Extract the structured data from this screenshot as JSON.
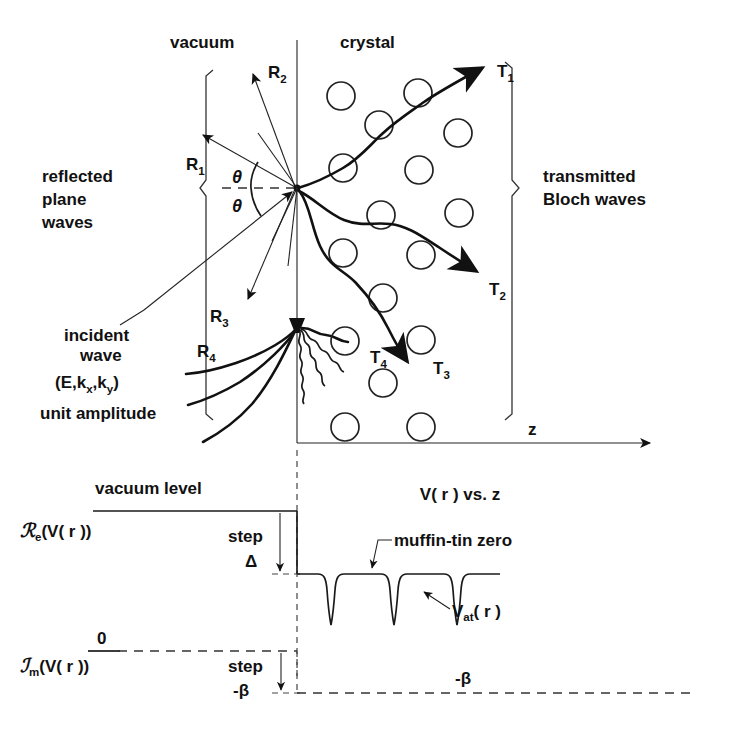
{
  "figure": {
    "regions": {
      "vacuum": "vacuum",
      "crystal": "crystal"
    },
    "left_bracket_label": [
      "reflected",
      "plane",
      "waves"
    ],
    "right_bracket_label": [
      "transmitted",
      "Bloch waves"
    ],
    "incident": {
      "line1": "incident",
      "line2": "wave",
      "line3_pre": "(E,k",
      "line3_subx": "x",
      "line3_mid": ",k",
      "line3_suby": "y",
      "line3_post": ")",
      "line4": "unit amplitude"
    },
    "angles": {
      "upper": "θ",
      "lower": "θ"
    },
    "reflected_beams": [
      {
        "base": "R",
        "sub": "1"
      },
      {
        "base": "R",
        "sub": "2"
      },
      {
        "base": "R",
        "sub": "3"
      },
      {
        "base": "R",
        "sub": "4"
      }
    ],
    "transmitted_beams": [
      {
        "base": "T",
        "sub": "1"
      },
      {
        "base": "T",
        "sub": "2"
      },
      {
        "base": "T",
        "sub": "3"
      },
      {
        "base": "T",
        "sub": "4"
      }
    ],
    "axis_label_z": "z"
  },
  "potential": {
    "title_pre": "V( r ) vs.",
    "title_post": " z",
    "vacuum_level": "vacuum level",
    "re_label": {
      "script": "ℛ",
      "sub": "e",
      "rest": "(V( r ))"
    },
    "im_label": {
      "script": "ℐ",
      "sub": "m",
      "rest": "(V( r ))"
    },
    "zero_label": "0",
    "step_real": {
      "word": "step",
      "value": "Δ"
    },
    "step_imag": {
      "word": "step",
      "value": "-β"
    },
    "beta_line_label": "-β",
    "muffin_tin_zero": "muffin-tin zero",
    "v_at": {
      "base": "V",
      "sub": "at",
      "rest": "( r )"
    }
  },
  "colors": {
    "ink": "#1a1a1a",
    "background": "#ffffff"
  }
}
